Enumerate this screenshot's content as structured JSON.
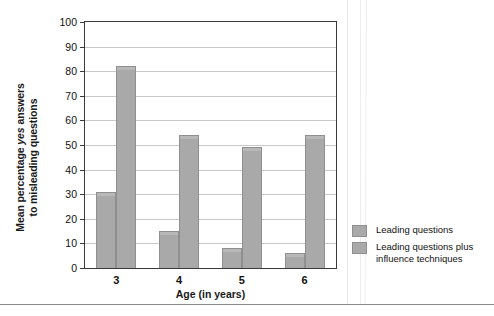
{
  "chart_data": {
    "type": "bar",
    "title": "",
    "xlabel": "Age (in years)",
    "ylabel": "Mean percentage yes answers to misleading questions",
    "ylabel_parts": {
      "before_italic": "Mean percentage ",
      "italic": "yes",
      "after_italic": " answers",
      "line2": "to misleading questions"
    },
    "categories": [
      "3",
      "4",
      "5",
      "6"
    ],
    "series": [
      {
        "name": "Leading questions",
        "values": [
          31,
          15,
          8,
          6
        ],
        "color": "#a9a9a9"
      },
      {
        "name": "Leading questions plus influence techniques",
        "values": [
          82,
          54,
          49,
          54
        ],
        "color": "#a9a9a9"
      }
    ],
    "ylim": [
      0,
      100
    ],
    "ytick_labels": [
      "0",
      "10",
      "20",
      "30",
      "40",
      "50",
      "60",
      "70",
      "80",
      "90",
      "100"
    ],
    "ytick_values": [
      0,
      10,
      20,
      30,
      40,
      50,
      60,
      70,
      80,
      90,
      100
    ],
    "grid": true,
    "legend_position": "right-bottom"
  },
  "legend": {
    "entries": [
      {
        "label": "Leading questions",
        "label_line2": ""
      },
      {
        "label": "Leading questions plus",
        "label_line2": "influence techniques"
      }
    ]
  }
}
